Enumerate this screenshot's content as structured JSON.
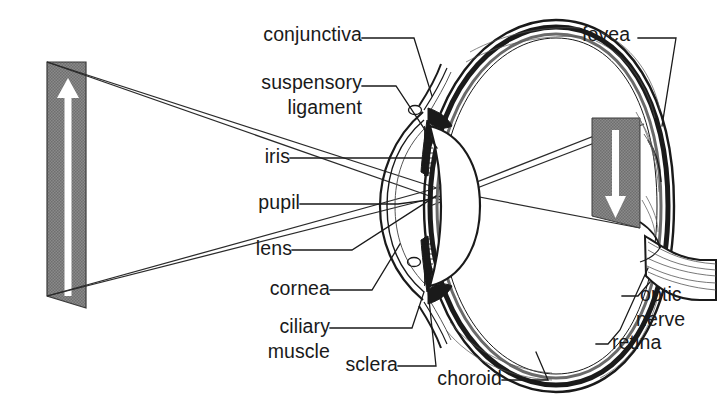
{
  "figure": {
    "width": 719,
    "height": 413,
    "background_color": "#ffffff",
    "ink_color": "#1a1a1a",
    "object_fill_color": "#808080",
    "arrow_fill_color": "#ffffff"
  },
  "labels": {
    "conjunctiva": "conjunctiva",
    "suspensory": "suspensory",
    "ligament": "ligament",
    "iris": "iris",
    "pupil": "pupil",
    "lens": "lens",
    "cornea": "cornea",
    "ciliary": "ciliary",
    "muscle": "muscle",
    "sclera": "sclera",
    "choroid": "choroid",
    "fovea": "fovea",
    "optic": "optic",
    "nerve": "nerve",
    "retina": "retina"
  },
  "diagram": {
    "object_arrow_direction": "up",
    "image_arrow_direction": "down",
    "object_label": "object",
    "image_label": "inverted image on retina",
    "ray_count": 4,
    "layers": [
      "sclera",
      "choroid",
      "retina"
    ]
  }
}
